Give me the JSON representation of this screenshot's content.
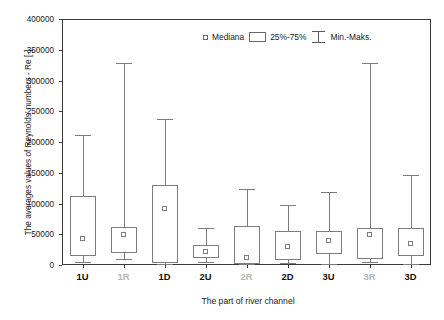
{
  "chart_data": {
    "type": "box",
    "title": "",
    "xlabel": "The part of river channel",
    "ylabel": "The averages values of Reynolds' numbers - Re [-]",
    "categories": [
      "1U",
      "1R",
      "1D",
      "2U",
      "2R",
      "2D",
      "3U",
      "3R",
      "3D"
    ],
    "category_styles": [
      "normal",
      "dim",
      "normal",
      "normal",
      "dim",
      "normal",
      "normal",
      "dim",
      "normal"
    ],
    "ylim": [
      0,
      400000
    ],
    "yticks": [
      0,
      50000,
      100000,
      150000,
      200000,
      250000,
      300000,
      350000,
      400000
    ],
    "ytick_labels": [
      "0",
      "50000",
      "100000",
      "150000",
      "200000",
      "250000",
      "300000",
      "350000",
      "400000"
    ],
    "grid": false,
    "legend_position": "top-right",
    "legend": [
      {
        "label": "Mediana",
        "glyph": "median-square"
      },
      {
        "label": "25%-75%",
        "glyph": "iqr-rect"
      },
      {
        "label": "Min.-Maks.",
        "glyph": "whisker-bar"
      }
    ],
    "boxes": [
      {
        "category": "1U",
        "min": 5000,
        "q1": 15000,
        "median": 43000,
        "q3": 112000,
        "max": 211000
      },
      {
        "category": "1R",
        "min": 10000,
        "q1": 20000,
        "median": 50000,
        "q3": 62000,
        "max": 328000
      },
      {
        "category": "1D",
        "min": 2000,
        "q1": 3000,
        "median": 92000,
        "q3": 130000,
        "max": 238000
      },
      {
        "category": "2U",
        "min": 5000,
        "q1": 12000,
        "median": 22000,
        "q3": 32000,
        "max": 60000
      },
      {
        "category": "2R",
        "min": 1000,
        "q1": 2000,
        "median": 13000,
        "q3": 63000,
        "max": 124000
      },
      {
        "category": "2D",
        "min": 3000,
        "q1": 8000,
        "median": 30000,
        "q3": 55000,
        "max": 97000
      },
      {
        "category": "3U",
        "min": 2000,
        "q1": 18000,
        "median": 40000,
        "q3": 55000,
        "max": 118000
      },
      {
        "category": "3R",
        "min": 5000,
        "q1": 9000,
        "median": 50000,
        "q3": 60000,
        "max": 328000
      },
      {
        "category": "3D",
        "min": 2000,
        "q1": 15000,
        "median": 35000,
        "q3": 60000,
        "max": 147000
      }
    ],
    "colors": {
      "axis": "#3a3a3a",
      "box_stroke": "#7d7d7d",
      "text": "#1a1a1a",
      "dim_text": "#b6b6b6",
      "background": "#ffffff"
    }
  }
}
